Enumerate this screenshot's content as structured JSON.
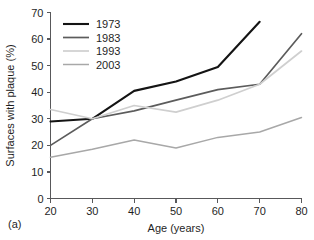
{
  "panel": {
    "label": "(a)"
  },
  "chart_data": {
    "type": "line",
    "title": "",
    "xlabel": "Age (years)",
    "ylabel": "Surfaces with plaque (%)",
    "xlim": [
      20,
      80
    ],
    "ylim": [
      0,
      70
    ],
    "xticks": [
      20,
      30,
      40,
      50,
      60,
      70,
      80
    ],
    "yticks": [
      0,
      10,
      20,
      30,
      40,
      50,
      60,
      70
    ],
    "xtick_labels": [
      "20",
      "30",
      "40",
      "50",
      "60",
      "70",
      "80"
    ],
    "ytick_labels": [
      "0",
      "10",
      "20",
      "30",
      "40",
      "50",
      "60",
      "70"
    ],
    "grid": false,
    "legend_position": "upper left",
    "series": [
      {
        "name": "1973",
        "color": "#141414",
        "width": 2.1,
        "x": [
          20,
          30,
          40,
          50,
          60,
          70
        ],
        "values": [
          29,
          30,
          40.5,
          44,
          49.5,
          66.5
        ]
      },
      {
        "name": "1983",
        "color": "#5c5c5c",
        "width": 1.7,
        "x": [
          20,
          30,
          40,
          50,
          60,
          70,
          80
        ],
        "values": [
          20,
          30,
          33,
          37,
          41,
          43,
          62
        ]
      },
      {
        "name": "1993",
        "color": "#cfcfcf",
        "width": 1.7,
        "x": [
          20,
          30,
          40,
          50,
          60,
          70,
          80
        ],
        "values": [
          33.5,
          30,
          35,
          32.5,
          37,
          43,
          55.5
        ]
      },
      {
        "name": "2003",
        "color": "#a8a8a8",
        "width": 1.5,
        "x": [
          20,
          30,
          40,
          50,
          60,
          70,
          80
        ],
        "values": [
          15.5,
          18.5,
          22,
          19,
          23,
          25,
          30.5
        ]
      }
    ]
  },
  "legend": {
    "entries": [
      {
        "label": "1973",
        "color": "#141414"
      },
      {
        "label": "1983",
        "color": "#5c5c5c"
      },
      {
        "label": "1993",
        "color": "#cfcfcf"
      },
      {
        "label": "2003",
        "color": "#a8a8a8"
      }
    ]
  }
}
